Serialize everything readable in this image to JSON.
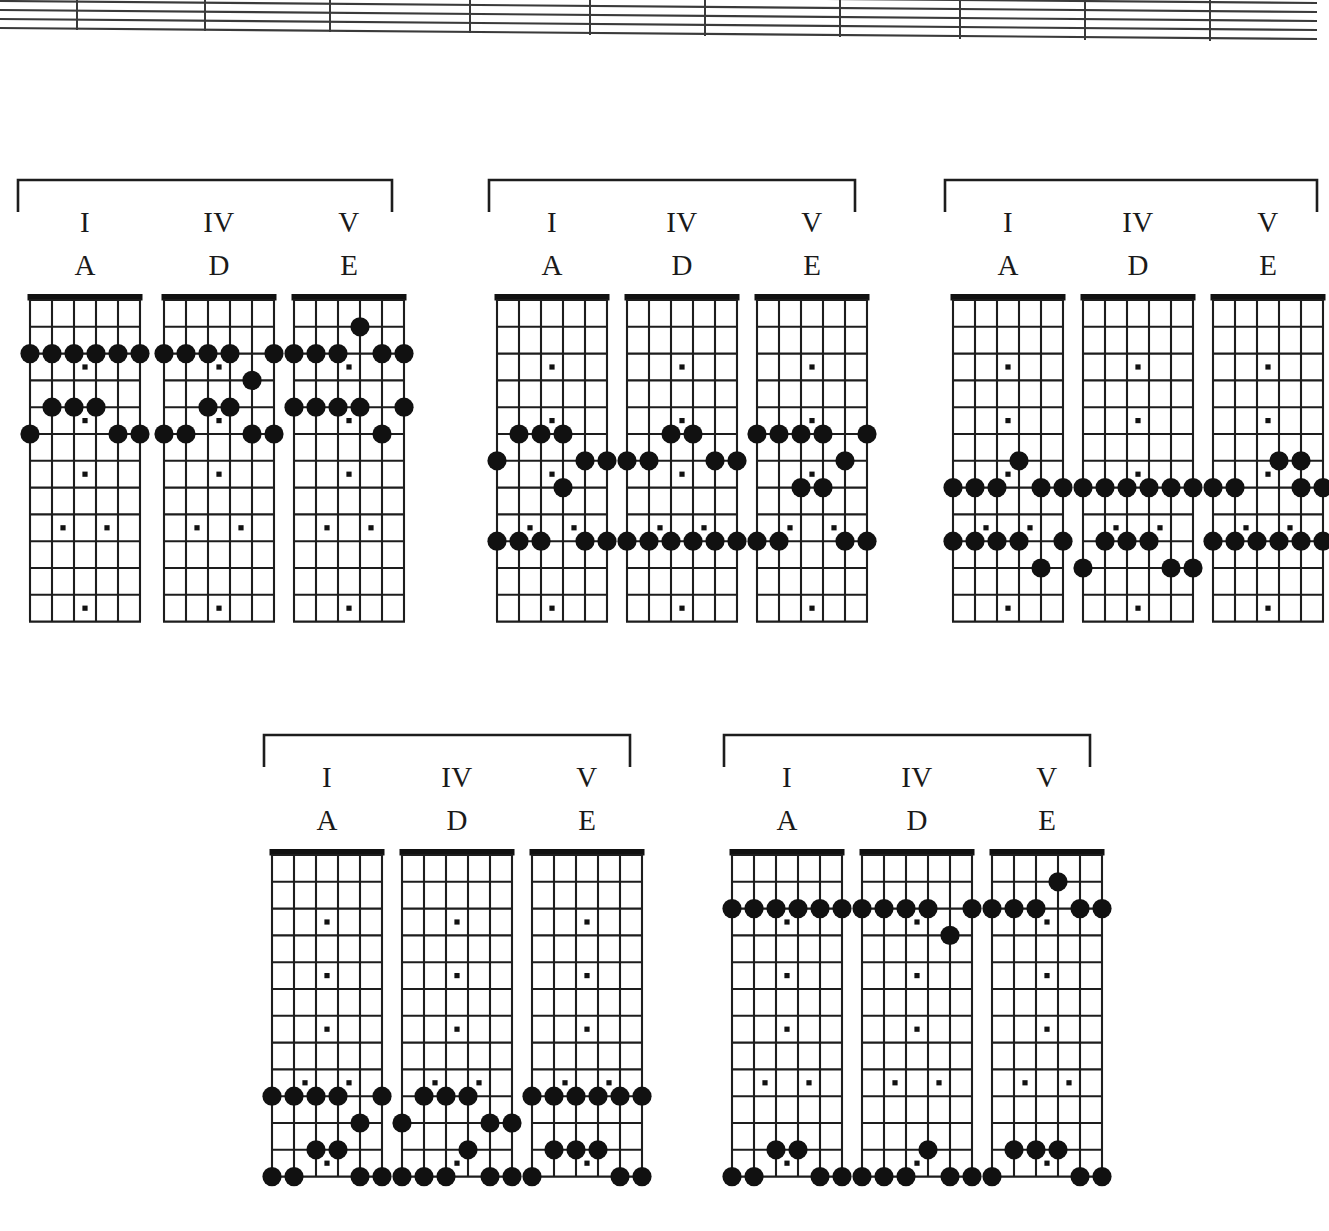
{
  "page": {
    "background": "#ffffff",
    "ink": "#1a1a1a"
  },
  "staff": {
    "name": "music-staff-fragment",
    "line_count": 5,
    "barline_count": 9,
    "description": "Bottom edge of a skewed five-line musical staff with barlines, cropped at the top of the page."
  },
  "diagram_defaults": {
    "strings": 6,
    "frets": 12,
    "string_names_low_to_high": [
      "E",
      "A",
      "D",
      "G",
      "B",
      "E"
    ],
    "inlay_frets": [
      3,
      5,
      7,
      9,
      12
    ],
    "double_inlay_fret": 9,
    "note_dot_color": "#111111",
    "inlay_dot_color": "#111111",
    "nut_color": "#111111"
  },
  "groups": [
    {
      "id": "group-1",
      "name": "chord-group-1",
      "position": {
        "left": 16,
        "top": 178,
        "width": 388,
        "height": 450
      },
      "bracket": {
        "width": 376,
        "height": 34
      },
      "charts": [
        {
          "name": "chart-I-A",
          "roman": "I",
          "chord": "A",
          "left": 8,
          "top": 112,
          "notes": [
            {
              "string": 1,
              "fret": 2
            },
            {
              "string": 2,
              "fret": 2
            },
            {
              "string": 3,
              "fret": 2
            },
            {
              "string": 4,
              "fret": 2
            },
            {
              "string": 5,
              "fret": 2
            },
            {
              "string": 6,
              "fret": 2
            },
            {
              "string": 2,
              "fret": 4
            },
            {
              "string": 3,
              "fret": 4
            },
            {
              "string": 4,
              "fret": 4
            },
            {
              "string": 1,
              "fret": 5
            },
            {
              "string": 5,
              "fret": 5
            },
            {
              "string": 6,
              "fret": 5
            }
          ]
        },
        {
          "name": "chart-IV-D",
          "roman": "IV",
          "chord": "D",
          "left": 142,
          "top": 112,
          "notes": [
            {
              "string": 1,
              "fret": 2
            },
            {
              "string": 2,
              "fret": 2
            },
            {
              "string": 3,
              "fret": 2
            },
            {
              "string": 4,
              "fret": 2
            },
            {
              "string": 6,
              "fret": 2
            },
            {
              "string": 5,
              "fret": 3
            },
            {
              "string": 3,
              "fret": 4
            },
            {
              "string": 4,
              "fret": 4
            },
            {
              "string": 1,
              "fret": 5
            },
            {
              "string": 2,
              "fret": 5
            },
            {
              "string": 5,
              "fret": 5
            },
            {
              "string": 6,
              "fret": 5
            }
          ]
        },
        {
          "name": "chart-V-E",
          "roman": "V",
          "chord": "E",
          "left": 272,
          "top": 112,
          "notes": [
            {
              "string": 4,
              "fret": 1
            },
            {
              "string": 1,
              "fret": 2
            },
            {
              "string": 2,
              "fret": 2
            },
            {
              "string": 3,
              "fret": 2
            },
            {
              "string": 5,
              "fret": 2
            },
            {
              "string": 6,
              "fret": 2
            },
            {
              "string": 1,
              "fret": 4
            },
            {
              "string": 2,
              "fret": 4
            },
            {
              "string": 3,
              "fret": 4
            },
            {
              "string": 4,
              "fret": 4
            },
            {
              "string": 6,
              "fret": 4
            },
            {
              "string": 5,
              "fret": 5
            }
          ]
        }
      ]
    },
    {
      "id": "group-2",
      "name": "chord-group-2",
      "position": {
        "left": 487,
        "top": 178,
        "width": 376,
        "height": 450
      },
      "bracket": {
        "width": 368,
        "height": 34
      },
      "charts": [
        {
          "name": "chart-I-A",
          "roman": "I",
          "chord": "A",
          "left": 4,
          "top": 112,
          "notes": [
            {
              "string": 2,
              "fret": 5
            },
            {
              "string": 3,
              "fret": 5
            },
            {
              "string": 4,
              "fret": 5
            },
            {
              "string": 1,
              "fret": 6
            },
            {
              "string": 5,
              "fret": 6
            },
            {
              "string": 6,
              "fret": 6
            },
            {
              "string": 4,
              "fret": 7
            },
            {
              "string": 1,
              "fret": 9
            },
            {
              "string": 2,
              "fret": 9
            },
            {
              "string": 3,
              "fret": 9
            },
            {
              "string": 5,
              "fret": 9
            },
            {
              "string": 6,
              "fret": 9
            }
          ]
        },
        {
          "name": "chart-IV-D",
          "roman": "IV",
          "chord": "D",
          "left": 134,
          "top": 112,
          "notes": [
            {
              "string": 3,
              "fret": 5
            },
            {
              "string": 4,
              "fret": 5
            },
            {
              "string": 1,
              "fret": 6
            },
            {
              "string": 2,
              "fret": 6
            },
            {
              "string": 5,
              "fret": 6
            },
            {
              "string": 6,
              "fret": 6
            },
            {
              "string": 1,
              "fret": 9
            },
            {
              "string": 2,
              "fret": 9
            },
            {
              "string": 3,
              "fret": 9
            },
            {
              "string": 4,
              "fret": 9
            },
            {
              "string": 5,
              "fret": 9
            },
            {
              "string": 6,
              "fret": 9
            }
          ]
        },
        {
          "name": "chart-V-E",
          "roman": "V",
          "chord": "E",
          "left": 264,
          "top": 112,
          "notes": [
            {
              "string": 1,
              "fret": 5
            },
            {
              "string": 2,
              "fret": 5
            },
            {
              "string": 3,
              "fret": 5
            },
            {
              "string": 4,
              "fret": 5
            },
            {
              "string": 6,
              "fret": 5
            },
            {
              "string": 5,
              "fret": 6
            },
            {
              "string": 3,
              "fret": 7
            },
            {
              "string": 4,
              "fret": 7
            },
            {
              "string": 1,
              "fret": 9
            },
            {
              "string": 2,
              "fret": 9
            },
            {
              "string": 5,
              "fret": 9
            },
            {
              "string": 6,
              "fret": 9
            }
          ]
        }
      ]
    },
    {
      "id": "group-3",
      "name": "chord-group-3",
      "position": {
        "left": 943,
        "top": 178,
        "width": 374,
        "height": 450
      },
      "bracket": {
        "width": 374,
        "height": 34
      },
      "charts": [
        {
          "name": "chart-I-A",
          "roman": "I",
          "chord": "A",
          "left": 4,
          "top": 112,
          "notes": [
            {
              "string": 4,
              "fret": 6
            },
            {
              "string": 1,
              "fret": 7
            },
            {
              "string": 2,
              "fret": 7
            },
            {
              "string": 3,
              "fret": 7
            },
            {
              "string": 5,
              "fret": 7
            },
            {
              "string": 6,
              "fret": 7
            },
            {
              "string": 1,
              "fret": 9
            },
            {
              "string": 2,
              "fret": 9
            },
            {
              "string": 3,
              "fret": 9
            },
            {
              "string": 4,
              "fret": 9
            },
            {
              "string": 6,
              "fret": 9
            },
            {
              "string": 5,
              "fret": 10
            }
          ]
        },
        {
          "name": "chart-IV-D",
          "roman": "IV",
          "chord": "D",
          "left": 134,
          "top": 112,
          "notes": [
            {
              "string": 1,
              "fret": 7
            },
            {
              "string": 2,
              "fret": 7
            },
            {
              "string": 3,
              "fret": 7
            },
            {
              "string": 4,
              "fret": 7
            },
            {
              "string": 5,
              "fret": 7
            },
            {
              "string": 6,
              "fret": 7
            },
            {
              "string": 2,
              "fret": 9
            },
            {
              "string": 3,
              "fret": 9
            },
            {
              "string": 4,
              "fret": 9
            },
            {
              "string": 1,
              "fret": 10
            },
            {
              "string": 5,
              "fret": 10
            },
            {
              "string": 6,
              "fret": 10
            }
          ]
        },
        {
          "name": "chart-V-E",
          "roman": "V",
          "chord": "E",
          "left": 264,
          "top": 112,
          "notes": [
            {
              "string": 4,
              "fret": 6
            },
            {
              "string": 5,
              "fret": 6
            },
            {
              "string": 1,
              "fret": 7
            },
            {
              "string": 2,
              "fret": 7
            },
            {
              "string": 5,
              "fret": 7
            },
            {
              "string": 6,
              "fret": 7
            },
            {
              "string": 1,
              "fret": 9
            },
            {
              "string": 2,
              "fret": 9
            },
            {
              "string": 3,
              "fret": 9
            },
            {
              "string": 4,
              "fret": 9
            },
            {
              "string": 5,
              "fret": 9
            },
            {
              "string": 6,
              "fret": 9
            }
          ]
        }
      ]
    },
    {
      "id": "group-4",
      "name": "chord-group-4",
      "position": {
        "left": 262,
        "top": 733,
        "width": 376,
        "height": 450
      },
      "bracket": {
        "width": 368,
        "height": 34
      },
      "charts": [
        {
          "name": "chart-I-A",
          "roman": "I",
          "chord": "A",
          "left": 4,
          "top": 112,
          "notes": [
            {
              "string": 1,
              "fret": 9
            },
            {
              "string": 2,
              "fret": 9
            },
            {
              "string": 3,
              "fret": 9
            },
            {
              "string": 4,
              "fret": 9
            },
            {
              "string": 6,
              "fret": 9
            },
            {
              "string": 5,
              "fret": 10
            },
            {
              "string": 3,
              "fret": 11
            },
            {
              "string": 4,
              "fret": 11
            },
            {
              "string": 1,
              "fret": 12
            },
            {
              "string": 2,
              "fret": 12
            },
            {
              "string": 5,
              "fret": 12
            },
            {
              "string": 6,
              "fret": 12
            }
          ]
        },
        {
          "name": "chart-IV-D",
          "roman": "IV",
          "chord": "D",
          "left": 134,
          "top": 112,
          "notes": [
            {
              "string": 2,
              "fret": 9
            },
            {
              "string": 3,
              "fret": 9
            },
            {
              "string": 4,
              "fret": 9
            },
            {
              "string": 1,
              "fret": 10
            },
            {
              "string": 5,
              "fret": 10
            },
            {
              "string": 6,
              "fret": 10
            },
            {
              "string": 4,
              "fret": 11
            },
            {
              "string": 1,
              "fret": 12
            },
            {
              "string": 2,
              "fret": 12
            },
            {
              "string": 3,
              "fret": 12
            },
            {
              "string": 5,
              "fret": 12
            },
            {
              "string": 6,
              "fret": 12
            }
          ]
        },
        {
          "name": "chart-V-E",
          "roman": "V",
          "chord": "E",
          "left": 264,
          "top": 112,
          "notes": [
            {
              "string": 1,
              "fret": 9
            },
            {
              "string": 2,
              "fret": 9
            },
            {
              "string": 3,
              "fret": 9
            },
            {
              "string": 4,
              "fret": 9
            },
            {
              "string": 5,
              "fret": 9
            },
            {
              "string": 6,
              "fret": 9
            },
            {
              "string": 2,
              "fret": 11
            },
            {
              "string": 3,
              "fret": 11
            },
            {
              "string": 4,
              "fret": 11
            },
            {
              "string": 1,
              "fret": 12
            },
            {
              "string": 5,
              "fret": 12
            },
            {
              "string": 6,
              "fret": 12
            }
          ]
        }
      ]
    },
    {
      "id": "group-5",
      "name": "chord-group-5",
      "position": {
        "left": 722,
        "top": 733,
        "width": 376,
        "height": 450
      },
      "bracket": {
        "width": 368,
        "height": 34
      },
      "charts": [
        {
          "name": "chart-I-A",
          "roman": "I",
          "chord": "A",
          "left": 4,
          "top": 112,
          "notes": [
            {
              "string": 3,
              "fret": 11
            },
            {
              "string": 4,
              "fret": 11
            },
            {
              "string": 1,
              "fret": 12
            },
            {
              "string": 2,
              "fret": 12
            },
            {
              "string": 5,
              "fret": 12
            },
            {
              "string": 6,
              "fret": 12
            },
            {
              "string": 1,
              "fret": 14
            },
            {
              "string": 2,
              "fret": 14
            },
            {
              "string": 3,
              "fret": 14
            },
            {
              "string": 4,
              "fret": 14
            },
            {
              "string": 5,
              "fret": 14
            },
            {
              "string": 6,
              "fret": 14
            }
          ]
        },
        {
          "name": "chart-IV-D",
          "roman": "IV",
          "chord": "D",
          "left": 134,
          "top": 112,
          "notes": [
            {
              "string": 4,
              "fret": 11
            },
            {
              "string": 1,
              "fret": 12
            },
            {
              "string": 2,
              "fret": 12
            },
            {
              "string": 3,
              "fret": 12
            },
            {
              "string": 5,
              "fret": 12
            },
            {
              "string": 6,
              "fret": 12
            },
            {
              "string": 1,
              "fret": 14
            },
            {
              "string": 2,
              "fret": 14
            },
            {
              "string": 3,
              "fret": 14
            },
            {
              "string": 4,
              "fret": 14
            },
            {
              "string": 6,
              "fret": 14
            },
            {
              "string": 5,
              "fret": 15
            }
          ]
        },
        {
          "name": "chart-V-E",
          "roman": "V",
          "chord": "E",
          "left": 264,
          "top": 112,
          "notes": [
            {
              "string": 2,
              "fret": 11
            },
            {
              "string": 3,
              "fret": 11
            },
            {
              "string": 4,
              "fret": 11
            },
            {
              "string": 1,
              "fret": 12
            },
            {
              "string": 5,
              "fret": 12
            },
            {
              "string": 6,
              "fret": 12
            },
            {
              "string": 4,
              "fret": 13
            },
            {
              "string": 1,
              "fret": 14
            },
            {
              "string": 2,
              "fret": 14
            },
            {
              "string": 3,
              "fret": 14
            },
            {
              "string": 5,
              "fret": 14
            },
            {
              "string": 6,
              "fret": 14
            }
          ]
        }
      ]
    }
  ]
}
